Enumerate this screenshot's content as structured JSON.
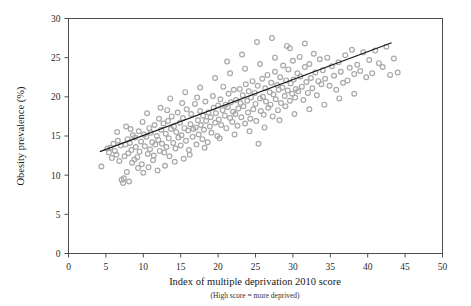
{
  "figure": {
    "background": "#ffffff",
    "frame_color": "#4d4d4d",
    "marker_color": "#a8a8a8",
    "trend_color": "#1a1a1a"
  },
  "chart_data": {
    "type": "scatter",
    "title": "",
    "xlabel": "Index of multiple deprivation 2010 score",
    "xsublabel": "(High score = more deprived)",
    "ylabel": "Obesity prevalence (%)",
    "xlim": [
      0,
      50
    ],
    "ylim": [
      0,
      30
    ],
    "xticks": [
      0,
      5,
      10,
      15,
      20,
      25,
      30,
      35,
      40,
      45,
      50
    ],
    "yticks": [
      0,
      5,
      10,
      15,
      20,
      25,
      30
    ],
    "grid": false,
    "legend": "none",
    "marker": "open-circle",
    "series": [
      {
        "name": "Local authorities",
        "points": [
          [
            4.4,
            11.1
          ],
          [
            5.2,
            13.4
          ],
          [
            5.4,
            12.9
          ],
          [
            5.6,
            13.5
          ],
          [
            5.8,
            12.2
          ],
          [
            6.0,
            14.0
          ],
          [
            6.2,
            13.1
          ],
          [
            6.4,
            12.6
          ],
          [
            6.6,
            14.4
          ],
          [
            6.8,
            11.8
          ],
          [
            7.0,
            13.8
          ],
          [
            7.1,
            9.4
          ],
          [
            7.3,
            9.0
          ],
          [
            7.4,
            9.6
          ],
          [
            7.5,
            12.4
          ],
          [
            7.6,
            13.9
          ],
          [
            7.8,
            10.4
          ],
          [
            7.9,
            14.6
          ],
          [
            8.0,
            12.8
          ],
          [
            8.1,
            9.2
          ],
          [
            8.2,
            14.1
          ],
          [
            8.4,
            13.2
          ],
          [
            8.5,
            11.6
          ],
          [
            8.6,
            15.1
          ],
          [
            8.8,
            12.0
          ],
          [
            8.9,
            14.8
          ],
          [
            9.0,
            13.6
          ],
          [
            9.2,
            12.3
          ],
          [
            9.4,
            15.6
          ],
          [
            9.5,
            13.0
          ],
          [
            9.7,
            14.3
          ],
          [
            9.8,
            11.4
          ],
          [
            10.0,
            10.3
          ],
          [
            10.1,
            15.2
          ],
          [
            10.2,
            13.7
          ],
          [
            10.4,
            14.9
          ],
          [
            10.6,
            12.7
          ],
          [
            10.8,
            16.0
          ],
          [
            10.9,
            13.3
          ],
          [
            11.0,
            15.4
          ],
          [
            11.2,
            14.2
          ],
          [
            11.4,
            12.5
          ],
          [
            11.5,
            16.4
          ],
          [
            11.6,
            13.9
          ],
          [
            11.8,
            15.0
          ],
          [
            12.0,
            14.5
          ],
          [
            12.1,
            17.2
          ],
          [
            12.2,
            13.1
          ],
          [
            12.4,
            15.8
          ],
          [
            12.5,
            14.0
          ],
          [
            12.7,
            16.6
          ],
          [
            12.8,
            12.9
          ],
          [
            13.0,
            15.3
          ],
          [
            13.1,
            13.6
          ],
          [
            13.3,
            16.9
          ],
          [
            13.4,
            14.7
          ],
          [
            13.5,
            12.4
          ],
          [
            13.7,
            15.9
          ],
          [
            13.8,
            17.5
          ],
          [
            14.0,
            14.1
          ],
          [
            14.1,
            16.2
          ],
          [
            14.3,
            13.4
          ],
          [
            14.4,
            15.5
          ],
          [
            14.6,
            18.0
          ],
          [
            14.7,
            14.8
          ],
          [
            14.9,
            16.7
          ],
          [
            15.0,
            13.8
          ],
          [
            15.1,
            15.1
          ],
          [
            15.3,
            17.3
          ],
          [
            15.4,
            12.1
          ],
          [
            15.5,
            16.0
          ],
          [
            15.7,
            14.4
          ],
          [
            15.8,
            18.4
          ],
          [
            16.0,
            15.7
          ],
          [
            16.1,
            13.2
          ],
          [
            16.3,
            16.5
          ],
          [
            16.4,
            17.8
          ],
          [
            16.6,
            14.9
          ],
          [
            16.7,
            15.9
          ],
          [
            16.9,
            19.1
          ],
          [
            17.0,
            16.1
          ],
          [
            17.1,
            13.9
          ],
          [
            17.3,
            17.0
          ],
          [
            17.4,
            15.2
          ],
          [
            17.6,
            18.2
          ],
          [
            17.7,
            16.4
          ],
          [
            17.9,
            14.6
          ],
          [
            18.0,
            17.6
          ],
          [
            18.1,
            15.8
          ],
          [
            18.3,
            19.4
          ],
          [
            18.4,
            16.9
          ],
          [
            18.6,
            14.2
          ],
          [
            18.7,
            18.0
          ],
          [
            18.9,
            16.2
          ],
          [
            19.0,
            17.4
          ],
          [
            19.1,
            15.4
          ],
          [
            19.3,
            20.1
          ],
          [
            19.4,
            18.6
          ],
          [
            19.6,
            16.7
          ],
          [
            19.7,
            17.9
          ],
          [
            19.9,
            15.0
          ],
          [
            20.0,
            18.9
          ],
          [
            20.1,
            17.1
          ],
          [
            20.3,
            19.7
          ],
          [
            20.4,
            16.4
          ],
          [
            20.6,
            18.3
          ],
          [
            20.7,
            21.3
          ],
          [
            20.9,
            17.6
          ],
          [
            21.0,
            19.0
          ],
          [
            21.1,
            16.0
          ],
          [
            21.3,
            18.7
          ],
          [
            21.4,
            20.4
          ],
          [
            21.6,
            17.3
          ],
          [
            21.7,
            19.3
          ],
          [
            21.9,
            16.8
          ],
          [
            22.0,
            18.1
          ],
          [
            22.1,
            20.9
          ],
          [
            22.3,
            17.8
          ],
          [
            22.4,
            19.6
          ],
          [
            22.6,
            16.3
          ],
          [
            22.7,
            18.5
          ],
          [
            22.9,
            21.0
          ],
          [
            23.0,
            19.2
          ],
          [
            23.1,
            17.4
          ],
          [
            23.3,
            20.2
          ],
          [
            23.4,
            18.8
          ],
          [
            23.6,
            16.6
          ],
          [
            23.7,
            21.6
          ],
          [
            23.9,
            19.5
          ],
          [
            24.0,
            18.0
          ],
          [
            24.1,
            20.7
          ],
          [
            24.3,
            17.2
          ],
          [
            24.4,
            19.9
          ],
          [
            24.6,
            22.0
          ],
          [
            24.7,
            18.4
          ],
          [
            24.9,
            20.5
          ],
          [
            25.0,
            19.1
          ],
          [
            25.1,
            16.9
          ],
          [
            25.3,
            21.4
          ],
          [
            25.4,
            14.0
          ],
          [
            25.6,
            19.8
          ],
          [
            25.7,
            18.2
          ],
          [
            25.9,
            22.3
          ],
          [
            26.0,
            20.0
          ],
          [
            26.1,
            17.7
          ],
          [
            26.3,
            21.1
          ],
          [
            26.4,
            19.4
          ],
          [
            26.6,
            22.8
          ],
          [
            26.7,
            18.6
          ],
          [
            26.9,
            20.6
          ],
          [
            27.0,
            19.0
          ],
          [
            27.1,
            21.8
          ],
          [
            27.3,
            17.5
          ],
          [
            27.4,
            20.3
          ],
          [
            27.6,
            23.2
          ],
          [
            27.7,
            19.7
          ],
          [
            27.9,
            21.5
          ],
          [
            28.0,
            18.3
          ],
          [
            28.1,
            20.9
          ],
          [
            28.3,
            22.5
          ],
          [
            28.4,
            19.2
          ],
          [
            28.6,
            21.2
          ],
          [
            28.7,
            24.0
          ],
          [
            28.9,
            20.1
          ],
          [
            29.0,
            18.8
          ],
          [
            29.1,
            22.1
          ],
          [
            29.3,
            20.8
          ],
          [
            29.4,
            23.5
          ],
          [
            29.6,
            19.5
          ],
          [
            29.7,
            21.7
          ],
          [
            29.9,
            20.4
          ],
          [
            30.0,
            24.6
          ],
          [
            30.1,
            22.2
          ],
          [
            30.3,
            19.9
          ],
          [
            30.4,
            21.0
          ],
          [
            30.6,
            23.0
          ],
          [
            30.7,
            20.7
          ],
          [
            30.9,
            25.1
          ],
          [
            31.0,
            22.6
          ],
          [
            31.2,
            21.3
          ],
          [
            31.4,
            19.6
          ],
          [
            31.6,
            23.8
          ],
          [
            31.8,
            21.9
          ],
          [
            32.0,
            20.5
          ],
          [
            32.2,
            24.2
          ],
          [
            32.4,
            22.4
          ],
          [
            32.6,
            21.1
          ],
          [
            32.8,
            25.5
          ],
          [
            33.0,
            23.1
          ],
          [
            33.2,
            20.2
          ],
          [
            33.4,
            22.0
          ],
          [
            33.6,
            24.8
          ],
          [
            33.8,
            21.6
          ],
          [
            34.0,
            23.4
          ],
          [
            34.3,
            22.3
          ],
          [
            34.6,
            25.0
          ],
          [
            34.9,
            21.4
          ],
          [
            35.2,
            23.9
          ],
          [
            35.5,
            22.7
          ],
          [
            35.8,
            20.9
          ],
          [
            36.1,
            24.4
          ],
          [
            36.4,
            23.2
          ],
          [
            36.7,
            21.8
          ],
          [
            37.0,
            25.3
          ],
          [
            37.3,
            22.1
          ],
          [
            37.6,
            23.7
          ],
          [
            37.9,
            26.0
          ],
          [
            38.2,
            22.9
          ],
          [
            38.6,
            24.1
          ],
          [
            39.0,
            23.3
          ],
          [
            39.4,
            25.7
          ],
          [
            39.8,
            22.5
          ],
          [
            40.2,
            24.7
          ],
          [
            40.6,
            23.0
          ],
          [
            41.0,
            25.9
          ],
          [
            41.5,
            24.3
          ],
          [
            42.0,
            23.8
          ],
          [
            42.5,
            26.4
          ],
          [
            43.0,
            22.8
          ],
          [
            43.5,
            24.9
          ],
          [
            44.0,
            23.1
          ],
          [
            6.5,
            15.5
          ],
          [
            7.7,
            16.2
          ],
          [
            9.9,
            16.8
          ],
          [
            11.3,
            11.9
          ],
          [
            12.9,
            11.2
          ],
          [
            14.2,
            11.7
          ],
          [
            16.2,
            12.6
          ],
          [
            18.2,
            13.5
          ],
          [
            20.2,
            14.7
          ],
          [
            22.2,
            15.2
          ],
          [
            24.2,
            15.6
          ],
          [
            26.2,
            16.1
          ],
          [
            28.2,
            17.0
          ],
          [
            30.2,
            17.8
          ],
          [
            32.2,
            18.4
          ],
          [
            34.2,
            19.0
          ],
          [
            36.2,
            19.8
          ],
          [
            38.2,
            20.4
          ],
          [
            13.6,
            19.8
          ],
          [
            15.6,
            20.6
          ],
          [
            17.6,
            21.2
          ],
          [
            19.6,
            22.4
          ],
          [
            21.6,
            23.0
          ],
          [
            23.6,
            23.6
          ],
          [
            25.6,
            24.2
          ],
          [
            27.6,
            25.0
          ],
          [
            29.6,
            26.2
          ],
          [
            31.6,
            26.8
          ],
          [
            25.2,
            27.0
          ],
          [
            27.2,
            27.5
          ],
          [
            29.2,
            26.5
          ],
          [
            23.2,
            25.4
          ],
          [
            21.2,
            24.5
          ],
          [
            10.5,
            17.9
          ],
          [
            12.3,
            18.6
          ],
          [
            8.3,
            15.9
          ],
          [
            9.3,
            10.9
          ],
          [
            10.7,
            11.0
          ],
          [
            11.9,
            10.6
          ],
          [
            13.2,
            18.3
          ],
          [
            15.2,
            19.2
          ],
          [
            17.2,
            19.9
          ]
        ]
      }
    ],
    "trendline": {
      "type": "linear",
      "x_start": 4.2,
      "y_start": 13.0,
      "x_end": 43.2,
      "y_end": 26.9
    }
  }
}
